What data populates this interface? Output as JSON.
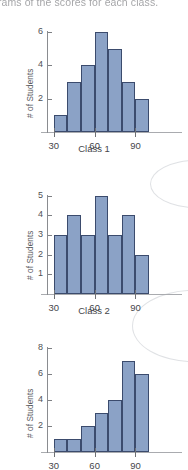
{
  "page": {
    "header_text_partial": "ograms of the scores for each class.",
    "bar_fill": "#8ba2c6",
    "bar_edge": "#3b4b6d",
    "axis_color": "#8a8c90",
    "background": "#ffffff"
  },
  "chart_data": [
    {
      "type": "bar",
      "title": "",
      "xlabel": "Class 1",
      "ylabel": "# of Students",
      "categories": [
        "30-40",
        "40-50",
        "50-60",
        "60-70",
        "70-80",
        "80-90",
        "90-100"
      ],
      "bin_edges": [
        30,
        40,
        50,
        60,
        70,
        80,
        90,
        100
      ],
      "values": [
        1,
        3,
        4,
        6,
        5,
        3,
        2
      ],
      "xticks": [
        30,
        60,
        90
      ],
      "xtick_labels": [
        "30",
        "60",
        "90"
      ],
      "yticks": [
        2,
        4,
        6
      ],
      "ytick_labels": [
        "2",
        "4",
        "6"
      ],
      "ylim": [
        0,
        6.6
      ],
      "xlim": [
        25,
        108
      ],
      "grid": false,
      "legend": "none"
    },
    {
      "type": "bar",
      "title": "",
      "xlabel": "Class 2",
      "ylabel": "# of Students",
      "categories": [
        "30-40",
        "40-50",
        "50-60",
        "60-70",
        "70-80",
        "80-90",
        "90-100"
      ],
      "bin_edges": [
        30,
        40,
        50,
        60,
        70,
        80,
        90,
        100
      ],
      "values": [
        3,
        4,
        3,
        5,
        3,
        4,
        2
      ],
      "xticks": [
        30,
        60,
        90
      ],
      "xtick_labels": [
        "30",
        "60",
        "90"
      ],
      "yticks": [
        1,
        2,
        3,
        4,
        5
      ],
      "ytick_labels": [
        "1",
        "2",
        "3",
        "4",
        "5"
      ],
      "ylim": [
        0,
        5.5
      ],
      "xlim": [
        25,
        108
      ],
      "grid": false,
      "legend": "none"
    },
    {
      "type": "bar",
      "title": "",
      "xlabel": "",
      "ylabel": "# of Students",
      "categories": [
        "30-40",
        "40-50",
        "50-60",
        "60-70",
        "70-80",
        "80-90",
        "90-100"
      ],
      "bin_edges": [
        30,
        40,
        50,
        60,
        70,
        80,
        90,
        100
      ],
      "values": [
        1,
        1,
        2,
        3,
        4,
        7,
        6
      ],
      "xticks": [
        30,
        60,
        90
      ],
      "xtick_labels": [
        "30",
        "60",
        "90"
      ],
      "yticks": [
        2,
        4,
        6,
        8
      ],
      "ytick_labels": [
        "2",
        "4",
        "6",
        "8"
      ],
      "ylim": [
        0,
        8.6
      ],
      "xlim": [
        25,
        108
      ],
      "grid": false,
      "legend": "none"
    }
  ]
}
